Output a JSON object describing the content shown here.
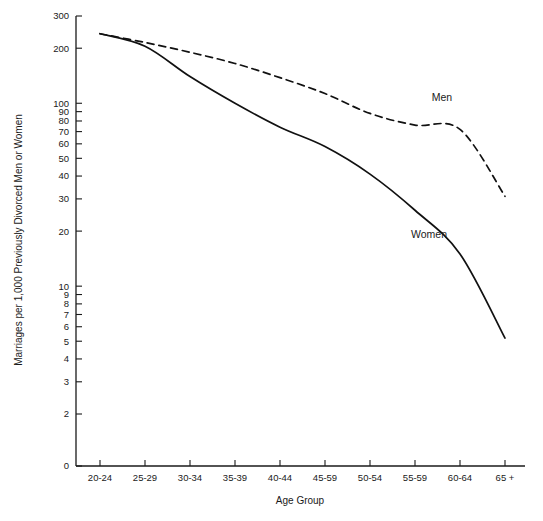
{
  "chart_data": {
    "type": "line",
    "title": "",
    "xlabel": "Age Group",
    "ylabel": "Marriages per 1,000 Previously Divorced Men or Women",
    "yscale": "log",
    "grid": false,
    "legend_position": "inline-annotation",
    "categories": [
      "20-24",
      "25-29",
      "30-34",
      "35-39",
      "40-44",
      "45-59",
      "50-54",
      "55-59",
      "60-64",
      "65 +"
    ],
    "ytick_labels": [
      "300",
      "200",
      "100",
      "90",
      "80",
      "70",
      "60",
      "50",
      "40",
      "30",
      "20",
      "10",
      "9",
      "8",
      "7",
      "6",
      "5",
      "4",
      "3",
      "2",
      "0"
    ],
    "ytick_values": [
      300,
      200,
      100,
      90,
      80,
      70,
      60,
      50,
      40,
      30,
      20,
      10,
      9,
      8,
      7,
      6,
      5,
      4,
      3,
      2,
      0
    ],
    "ylim": [
      2,
      300
    ],
    "series": [
      {
        "name": "Men",
        "style": "dashed",
        "label_x_category": "60-64",
        "label_offset_x": -18,
        "label_offset_y": -28,
        "values": [
          240,
          215,
          190,
          165,
          138,
          113,
          88,
          76,
          72,
          31
        ]
      },
      {
        "name": "Women",
        "style": "solid",
        "label_x_category": "55-59",
        "label_offset_x": 14,
        "label_offset_y": 28,
        "values": [
          240,
          205,
          140,
          100,
          74,
          58,
          41,
          26,
          15,
          5.2
        ]
      }
    ]
  }
}
